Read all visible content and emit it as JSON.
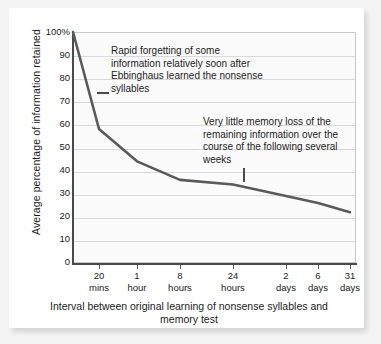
{
  "chart_data": {
    "type": "line",
    "title": "",
    "subtitle": "",
    "xlabel": "Interval between original learning of nonsense syllables and memory test",
    "ylabel": "Average percentage of information retained",
    "ylim": [
      0,
      100
    ],
    "yticks": [
      "0",
      "10",
      "20",
      "30",
      "40",
      "50",
      "60",
      "70",
      "80",
      "90",
      "100%"
    ],
    "ytick_values": [
      0,
      10,
      20,
      30,
      40,
      50,
      60,
      70,
      80,
      90,
      100
    ],
    "categories": [
      "20 mins",
      "1 hour",
      "8 hours",
      "24 hours",
      "2 days",
      "6 days",
      "31 days"
    ],
    "xtick_labels": [
      {
        "line1": "20",
        "line2": "mins"
      },
      {
        "line1": "1",
        "line2": "hour"
      },
      {
        "line1": "8",
        "line2": "hours"
      },
      {
        "line1": "24",
        "line2": "hours"
      },
      {
        "line1": "2",
        "line2": "days"
      },
      {
        "line1": "6",
        "line2": "days"
      },
      {
        "line1": "31",
        "line2": "days"
      }
    ],
    "grid": true,
    "legend": "none",
    "series": [
      {
        "name": "Retention",
        "points": [
          {
            "x": "immediately",
            "y": 100
          },
          {
            "x": "20 mins",
            "y": 58
          },
          {
            "x": "1 hour",
            "y": 44
          },
          {
            "x": "8 hours",
            "y": 36
          },
          {
            "x": "24 hours",
            "y": 34
          },
          {
            "x": "2 days",
            "y": 29
          },
          {
            "x": "6 days",
            "y": 26
          },
          {
            "x": "31 days",
            "y": 22
          }
        ],
        "color": "#5a5a5a"
      }
    ],
    "annotations": [
      {
        "id": "rapid-forgetting",
        "text": "Rapid forgetting of some information relatively soon after Ebbinghaus learned the nonsense syllables",
        "leader": "horizontal"
      },
      {
        "id": "little-loss",
        "text": "Very little memory loss of the remaining information over the course of the following several weeks",
        "leader": "vertical"
      }
    ],
    "colors": {
      "curve": "#5a5a5a",
      "axis": "#4a4a4a",
      "grid": "#d9d9d9",
      "plot_background": "#fbfbfb",
      "page_background": "#ffffff",
      "text": "#1c1c1c"
    }
  }
}
